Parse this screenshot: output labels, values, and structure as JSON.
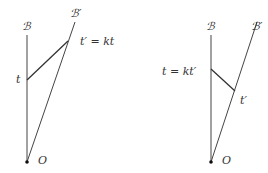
{
  "diagrams": [
    {
      "name": "left",
      "labels": {
        "worldline_B": "ℬ",
        "worldline_Bprime": "ℬ′",
        "event_t": "t",
        "event_tprime": "t′ = kt",
        "origin": "O"
      }
    },
    {
      "name": "right",
      "labels": {
        "worldline_B": "ℬ",
        "worldline_Bprime": "ℬ′",
        "event_t": "t = kt′",
        "event_tprime": "t′",
        "origin": "O"
      }
    }
  ]
}
